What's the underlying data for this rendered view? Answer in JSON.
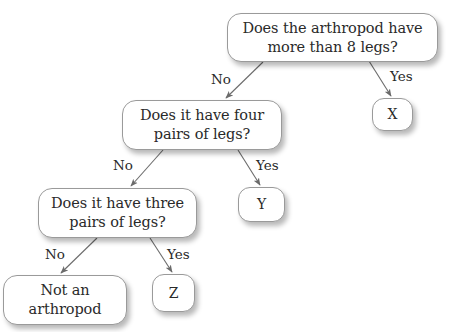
{
  "diagram": {
    "type": "decision-tree",
    "nodes": {
      "root": {
        "text_line1": "Does the arthropod have",
        "text_line2": "more than 8 legs?"
      },
      "x": {
        "text": "X"
      },
      "four_pairs": {
        "text_line1": "Does it have four",
        "text_line2": "pairs of legs?"
      },
      "y": {
        "text": "Y"
      },
      "three_pairs": {
        "text_line1": "Does it have three",
        "text_line2": "pairs of legs?"
      },
      "not_arthropod": {
        "text_line1": "Not an",
        "text_line2": "arthropod"
      },
      "z": {
        "text": "Z"
      }
    },
    "edges": {
      "root_no": {
        "label": "No",
        "from": "root",
        "to": "four_pairs"
      },
      "root_yes": {
        "label": "Yes",
        "from": "root",
        "to": "x"
      },
      "four_no": {
        "label": "No",
        "from": "four_pairs",
        "to": "three_pairs"
      },
      "four_yes": {
        "label": "Yes",
        "from": "four_pairs",
        "to": "y"
      },
      "three_no": {
        "label": "No",
        "from": "three_pairs",
        "to": "not_arthropod"
      },
      "three_yes": {
        "label": "Yes",
        "from": "three_pairs",
        "to": "z"
      }
    },
    "colors": {
      "node_border": "#9a9a9a",
      "arrow": "#6b6b6b",
      "text": "#2a2a2a",
      "background": "#ffffff"
    }
  }
}
